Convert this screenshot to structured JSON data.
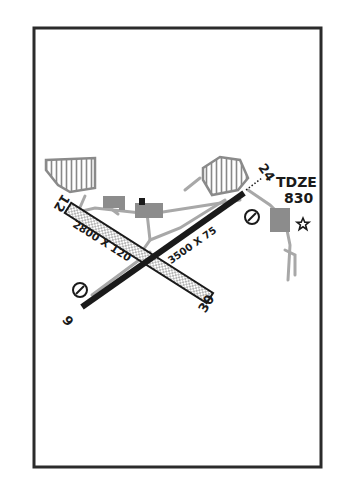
{
  "diagram": {
    "type": "airport-diagram",
    "frame": {
      "x": 34,
      "y": 28,
      "width": 287,
      "height": 439
    },
    "colors": {
      "ink": "#1a1a1a",
      "frame": "#2b2b2b",
      "taxiway": "#a8a8a8",
      "building": "#8c8c8c",
      "background": "#ffffff"
    },
    "runways": [
      {
        "id": "6-24",
        "ends": [
          "6",
          "24"
        ],
        "dimensions": "3500 X 75",
        "surface": "hard",
        "from": [
          82,
          307
        ],
        "to": [
          244,
          193
        ]
      },
      {
        "id": "12-30",
        "ends": [
          "12",
          "30"
        ],
        "dimensions": "2800 X 120",
        "surface": "turf-stippled",
        "from": [
          68,
          208
        ],
        "to": [
          210,
          298
        ]
      }
    ],
    "labels": {
      "rwy_12": "12",
      "rwy_30": "30",
      "rwy_6": "6",
      "rwy_24": "24",
      "rwy_12_30_dims": "2800 X 120",
      "rwy_6_24_dims": "3500 X 75",
      "tdze_label": "TDZE",
      "tdze_value": "830"
    },
    "icons": {
      "beacon": "star-icon",
      "no_entry_markers": [
        "no-entry-circle-icon",
        "no-entry-circle-icon"
      ]
    }
  }
}
